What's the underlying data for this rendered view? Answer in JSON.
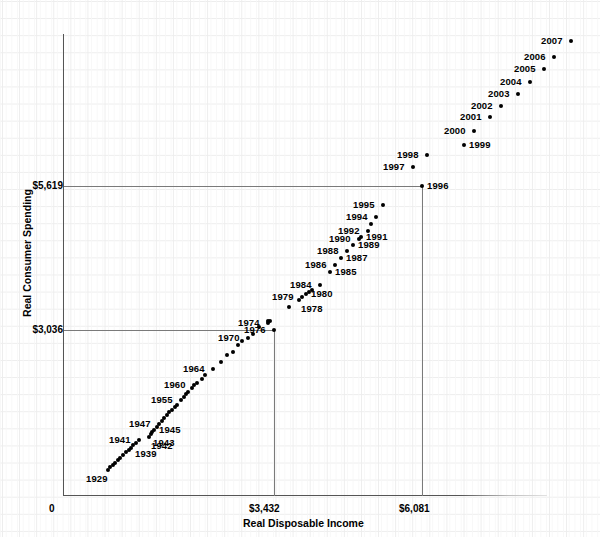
{
  "chart": {
    "type": "scatter",
    "title": "",
    "xlabel": "Real Disposable Income",
    "ylabel": "Real Consumer Spending",
    "x_ticks": [
      "0",
      "$3,432",
      "$6,081"
    ],
    "y_ticks": [
      "$3,036",
      "$5,619"
    ],
    "reference_lines": {
      "horizontal": [
        "$3,036",
        "$5,619"
      ],
      "vertical": [
        "$3,432",
        "$6,081"
      ]
    },
    "grid": true,
    "legend": "none"
  },
  "chart_data": {
    "type": "scatter",
    "title": "",
    "xlabel": "Real Disposable Income",
    "ylabel": "Real Consumer Spending",
    "xlim": [
      0,
      7900
    ],
    "ylim": [
      0,
      8500
    ],
    "x_tick_values": [
      0,
      3432,
      6081
    ],
    "y_tick_values": [
      3036,
      5619
    ],
    "x_tick_labels": [
      "0",
      "$3,432",
      "$6,081"
    ],
    "y_tick_labels": [
      "$3,036",
      "$5,619"
    ],
    "grid": true,
    "legend_position": "none",
    "point_label_field": "year",
    "points": [
      {
        "year": "1929",
        "x": 740,
        "y": 840,
        "px": 108,
        "py": 470,
        "label": "1929",
        "label_pos": "bl"
      },
      {
        "year": "1930",
        "x": 780,
        "y": 880,
        "px": 110,
        "py": 467,
        "label": "",
        "label_pos": ""
      },
      {
        "year": "1931",
        "x": 820,
        "y": 925,
        "px": 113,
        "py": 465,
        "label": "",
        "label_pos": ""
      },
      {
        "year": "1932",
        "x": 855,
        "y": 960,
        "px": 115,
        "py": 463,
        "label": "",
        "label_pos": ""
      },
      {
        "year": "1933",
        "x": 900,
        "y": 1000,
        "px": 118,
        "py": 460,
        "label": "",
        "label_pos": ""
      },
      {
        "year": "1934",
        "x": 940,
        "y": 1045,
        "px": 120,
        "py": 458,
        "label": "",
        "label_pos": ""
      },
      {
        "year": "1935",
        "x": 985,
        "y": 1090,
        "px": 123,
        "py": 455,
        "label": "",
        "label_pos": ""
      },
      {
        "year": "1936",
        "x": 1025,
        "y": 1135,
        "px": 126,
        "py": 452,
        "label": "",
        "label_pos": ""
      },
      {
        "year": "1937",
        "x": 1070,
        "y": 1180,
        "px": 129,
        "py": 450,
        "label": "",
        "label_pos": ""
      },
      {
        "year": "1938",
        "x": 1100,
        "y": 1220,
        "px": 131,
        "py": 448,
        "label": "",
        "label_pos": ""
      },
      {
        "year": "1939",
        "x": 1145,
        "y": 1255,
        "px": 133,
        "py": 445,
        "label": "1939",
        "label_pos": "br"
      },
      {
        "year": "1940",
        "x": 1190,
        "y": 1290,
        "px": 136,
        "py": 443,
        "label": "",
        "label_pos": ""
      },
      {
        "year": "1941",
        "x": 1240,
        "y": 1340,
        "px": 139,
        "py": 440,
        "label": "1941",
        "label_pos": "l"
      },
      {
        "year": "1942",
        "x": 1395,
        "y": 1395,
        "px": 149,
        "py": 437,
        "label": "1942",
        "label_pos": "br"
      },
      {
        "year": "1943",
        "x": 1420,
        "y": 1420,
        "px": 151,
        "py": 434,
        "label": "1943",
        "label_pos": "br"
      },
      {
        "year": "1944",
        "x": 1450,
        "y": 1450,
        "px": 152,
        "py": 432,
        "label": "",
        "label_pos": ""
      },
      {
        "year": "1945",
        "x": 1480,
        "y": 1490,
        "px": 154,
        "py": 430,
        "label": "1945",
        "label_pos": "r"
      },
      {
        "year": "1946",
        "x": 1530,
        "y": 1540,
        "px": 157,
        "py": 427,
        "label": "",
        "label_pos": ""
      },
      {
        "year": "1947",
        "x": 1570,
        "y": 1570,
        "px": 159,
        "py": 424,
        "label": "1947",
        "label_pos": "l"
      },
      {
        "year": "1948",
        "x": 1610,
        "y": 1600,
        "px": 162,
        "py": 421,
        "label": "",
        "label_pos": ""
      },
      {
        "year": "1949",
        "x": 1640,
        "y": 1640,
        "px": 164,
        "py": 418,
        "label": "",
        "label_pos": ""
      },
      {
        "year": "1950",
        "x": 1690,
        "y": 1700,
        "px": 167,
        "py": 415,
        "label": "",
        "label_pos": ""
      },
      {
        "year": "1951",
        "x": 1730,
        "y": 1730,
        "px": 169,
        "py": 412,
        "label": "",
        "label_pos": ""
      },
      {
        "year": "1952",
        "x": 1770,
        "y": 1770,
        "px": 172,
        "py": 410,
        "label": "",
        "label_pos": ""
      },
      {
        "year": "1953",
        "x": 1820,
        "y": 1820,
        "px": 175,
        "py": 407,
        "label": "",
        "label_pos": ""
      },
      {
        "year": "1954",
        "x": 1850,
        "y": 1855,
        "px": 177,
        "py": 405,
        "label": "",
        "label_pos": ""
      },
      {
        "year": "1955",
        "x": 1920,
        "y": 1930,
        "px": 181,
        "py": 400,
        "label": "1955",
        "label_pos": "l"
      },
      {
        "year": "1956",
        "x": 1970,
        "y": 1970,
        "px": 184,
        "py": 397,
        "label": "",
        "label_pos": ""
      },
      {
        "year": "1957",
        "x": 2000,
        "y": 2000,
        "px": 186,
        "py": 394,
        "label": "",
        "label_pos": ""
      },
      {
        "year": "1958",
        "x": 2030,
        "y": 2020,
        "px": 188,
        "py": 392,
        "label": "",
        "label_pos": ""
      },
      {
        "year": "1959",
        "x": 2090,
        "y": 2090,
        "px": 192,
        "py": 388,
        "label": "",
        "label_pos": ""
      },
      {
        "year": "1960",
        "x": 2130,
        "y": 2130,
        "px": 194,
        "py": 385,
        "label": "1960",
        "label_pos": "l"
      },
      {
        "year": "1961",
        "x": 2180,
        "y": 2160,
        "px": 197,
        "py": 383,
        "label": "",
        "label_pos": ""
      },
      {
        "year": "1962",
        "x": 2250,
        "y": 2240,
        "px": 202,
        "py": 379,
        "label": "",
        "label_pos": ""
      },
      {
        "year": "1963",
        "x": 2300,
        "y": 2310,
        "px": 205,
        "py": 375,
        "label": "",
        "label_pos": ""
      },
      {
        "year": "1964",
        "x": 2440,
        "y": 2430,
        "px": 213,
        "py": 369,
        "label": "1964",
        "label_pos": "l"
      },
      {
        "year": "1965",
        "x": 2570,
        "y": 2560,
        "px": 221,
        "py": 362,
        "label": "",
        "label_pos": ""
      },
      {
        "year": "1966",
        "x": 2670,
        "y": 2680,
        "px": 227,
        "py": 355,
        "label": "",
        "label_pos": ""
      },
      {
        "year": "1967",
        "x": 2760,
        "y": 2740,
        "px": 233,
        "py": 352,
        "label": "",
        "label_pos": ""
      },
      {
        "year": "1968",
        "x": 2840,
        "y": 2860,
        "px": 238,
        "py": 345,
        "label": "",
        "label_pos": ""
      },
      {
        "year": "1969",
        "x": 2910,
        "y": 2940,
        "px": 242,
        "py": 341,
        "label": "",
        "label_pos": ""
      },
      {
        "year": "1970",
        "x": 3010,
        "y": 2990,
        "px": 248,
        "py": 338,
        "label": "1970",
        "label_pos": "l"
      },
      {
        "year": "1971",
        "x": 3090,
        "y": 3060,
        "px": 253,
        "py": 334,
        "label": "",
        "label_pos": ""
      },
      {
        "year": "1972",
        "x": 3190,
        "y": 3190,
        "px": 259,
        "py": 327,
        "label": "",
        "label_pos": ""
      },
      {
        "year": "1973",
        "x": 3330,
        "y": 3290,
        "px": 268,
        "py": 321,
        "label": "",
        "label_pos": ""
      },
      {
        "year": "1974",
        "x": 3330,
        "y": 3260,
        "px": 268,
        "py": 323,
        "label": "1974",
        "label_pos": "l"
      },
      {
        "year": "1975",
        "x": 3370,
        "y": 3290,
        "px": 270,
        "py": 321,
        "label": "",
        "label_pos": ""
      },
      {
        "year": "1976",
        "x": 3432,
        "y": 3036,
        "px": 274,
        "py": 330,
        "label": "1976",
        "label_pos": "l"
      },
      {
        "year": "1977",
        "x": 3680,
        "y": 3560,
        "px": 289,
        "py": 307,
        "label": "",
        "label_pos": ""
      },
      {
        "year": "1978",
        "x": 3840,
        "y": 3680,
        "px": 299,
        "py": 300,
        "label": "1978",
        "label_pos": "br"
      },
      {
        "year": "1979",
        "x": 3900,
        "y": 3760,
        "px": 302,
        "py": 297,
        "label": "1979",
        "label_pos": "l"
      },
      {
        "year": "1980",
        "x": 3960,
        "y": 3800,
        "px": 306,
        "py": 294,
        "label": "1980",
        "label_pos": "r"
      },
      {
        "year": "1981",
        "x": 4010,
        "y": 3830,
        "px": 309,
        "py": 292,
        "label": "",
        "label_pos": ""
      },
      {
        "year": "1982",
        "x": 4050,
        "y": 3880,
        "px": 312,
        "py": 290,
        "label": "",
        "label_pos": ""
      },
      {
        "year": "1984",
        "x": 4190,
        "y": 4050,
        "px": 320,
        "py": 285,
        "label": "1984",
        "label_pos": "l"
      },
      {
        "year": "1985",
        "x": 4340,
        "y": 4290,
        "px": 330,
        "py": 272,
        "label": "1985",
        "label_pos": "r"
      },
      {
        "year": "1986",
        "x": 4430,
        "y": 4420,
        "px": 335,
        "py": 265,
        "label": "1986",
        "label_pos": "l"
      },
      {
        "year": "1987",
        "x": 4530,
        "y": 4560,
        "px": 341,
        "py": 258,
        "label": "1987",
        "label_pos": "r"
      },
      {
        "year": "1988",
        "x": 4630,
        "y": 4690,
        "px": 347,
        "py": 251,
        "label": "1988",
        "label_pos": "l"
      },
      {
        "year": "1989",
        "x": 4720,
        "y": 4790,
        "px": 353,
        "py": 245,
        "label": "1989",
        "label_pos": "r"
      },
      {
        "year": "1990",
        "x": 4830,
        "y": 4900,
        "px": 359,
        "py": 239,
        "label": "1990",
        "label_pos": "l"
      },
      {
        "year": "1991",
        "x": 4860,
        "y": 4930,
        "px": 361,
        "py": 237,
        "label": "1991",
        "label_pos": "r"
      },
      {
        "year": "1992",
        "x": 4960,
        "y": 5030,
        "px": 368,
        "py": 231,
        "label": "1992",
        "label_pos": "l"
      },
      {
        "year": "1993",
        "x": 5010,
        "y": 5130,
        "px": 371,
        "py": 224,
        "label": "",
        "label_pos": ""
      },
      {
        "year": "1994",
        "x": 5100,
        "y": 5250,
        "px": 376,
        "py": 217,
        "label": "1994",
        "label_pos": "l"
      },
      {
        "year": "1995",
        "x": 5220,
        "y": 5400,
        "px": 383,
        "py": 205,
        "label": "1995",
        "label_pos": "l"
      },
      {
        "year": "1996",
        "x": 6081,
        "y": 5619,
        "px": 422,
        "py": 186,
        "label": "1996",
        "label_pos": "r"
      },
      {
        "year": "1997",
        "x": 5620,
        "y": 5840,
        "px": 413,
        "py": 167,
        "label": "1997",
        "label_pos": "l"
      },
      {
        "year": "1998",
        "x": 5840,
        "y": 6070,
        "px": 427,
        "py": 155,
        "label": "1998",
        "label_pos": "l"
      },
      {
        "year": "1999",
        "x": 6010,
        "y": 6290,
        "px": 464,
        "py": 145,
        "label": "1999",
        "label_pos": "r"
      },
      {
        "year": "2000",
        "x": 6200,
        "y": 6500,
        "px": 474,
        "py": 131,
        "label": "2000",
        "label_pos": "l"
      },
      {
        "year": "2001",
        "x": 6350,
        "y": 6620,
        "px": 490,
        "py": 117,
        "label": "2001",
        "label_pos": "l"
      },
      {
        "year": "2002",
        "x": 6510,
        "y": 6750,
        "px": 501,
        "py": 106,
        "label": "2002",
        "label_pos": "l"
      },
      {
        "year": "2003",
        "x": 6630,
        "y": 6900,
        "px": 518,
        "py": 94,
        "label": "2003",
        "label_pos": "l"
      },
      {
        "year": "2004",
        "x": 6780,
        "y": 7060,
        "px": 530,
        "py": 82,
        "label": "2004",
        "label_pos": "l"
      },
      {
        "year": "2005",
        "x": 6900,
        "y": 7210,
        "px": 544,
        "py": 69,
        "label": "2005",
        "label_pos": "l"
      },
      {
        "year": "2006",
        "x": 7080,
        "y": 7380,
        "px": 554,
        "py": 57,
        "label": "2006",
        "label_pos": "l"
      },
      {
        "year": "2007",
        "x": 7230,
        "y": 7520,
        "px": 571,
        "py": 41,
        "label": "2007",
        "label_pos": "l"
      }
    ]
  }
}
